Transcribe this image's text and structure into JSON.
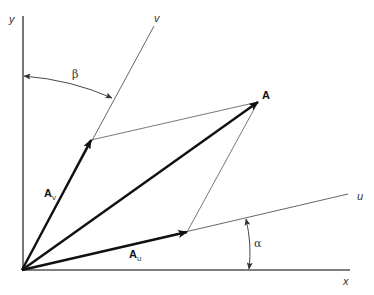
{
  "diagram": {
    "type": "vector-decomposition",
    "colors": {
      "axis": "#555555",
      "vector": "#111111",
      "construction": "#555555",
      "background": "#ffffff"
    },
    "axes": {
      "x": {
        "label": "x"
      },
      "y": {
        "label": "y"
      },
      "u": {
        "label": "u"
      },
      "v": {
        "label": "v"
      }
    },
    "vectors": {
      "A": {
        "label": "A"
      },
      "Au": {
        "label": "A",
        "subscript": "u"
      },
      "Av": {
        "label": "A",
        "subscript": "v"
      }
    },
    "angles": {
      "alpha": {
        "label": "α",
        "between": "x and u"
      },
      "beta": {
        "label": "β",
        "between": "y and v"
      }
    }
  }
}
